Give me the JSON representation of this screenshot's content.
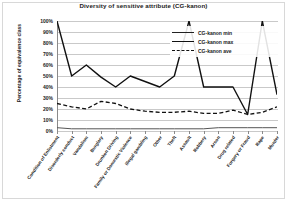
{
  "chart_data": {
    "type": "line",
    "title": "Diversity of sensitive attribute (CG-kanon)",
    "xlabel": "",
    "ylabel": "Percentage of equivalence class",
    "ylim": [
      0,
      100
    ],
    "ytick_labels": [
      "100%",
      "90%",
      "80%",
      "70%",
      "60%",
      "50%",
      "40%",
      "30%",
      "20%",
      "10%",
      "0%"
    ],
    "ytick_values": [
      100,
      90,
      80,
      70,
      60,
      50,
      40,
      30,
      20,
      10,
      0
    ],
    "grid": true,
    "legend_position": "top-right",
    "categories": [
      "Condition of Enlistment",
      "Disorderly conduct",
      "Vandalism",
      "Burglary",
      "Drunken Driving",
      "Family or Domestic Violence",
      "Illegal gambling",
      "Other",
      "Theft",
      "Assault",
      "Robbery",
      "Arson",
      "Drug related",
      "Forgery or Fraud",
      "Rape",
      "Murder"
    ],
    "series": [
      {
        "name": "CG-kanon min",
        "style": "thin-solid",
        "color": "#555555",
        "values": [
          3,
          2,
          2,
          2,
          2,
          2,
          2,
          2,
          2,
          2,
          2,
          3,
          3,
          3,
          3,
          3
        ]
      },
      {
        "name": "CG-kanon max",
        "style": "thick-solid",
        "color": "#111111",
        "values": [
          100,
          50,
          60,
          49,
          40,
          50,
          45,
          40,
          50,
          100,
          40,
          40,
          40,
          15,
          100,
          33
        ]
      },
      {
        "name": "CG-kanon ave",
        "style": "dashed",
        "color": "#111111",
        "values": [
          25,
          22,
          20,
          27,
          25,
          20,
          18,
          17,
          17,
          18,
          16,
          16,
          19,
          15,
          17,
          22
        ]
      }
    ]
  },
  "legend": {
    "items": [
      {
        "label": "CG-kanon min"
      },
      {
        "label": "CG-kanon max"
      },
      {
        "label": "CG-kanon ave"
      }
    ]
  }
}
